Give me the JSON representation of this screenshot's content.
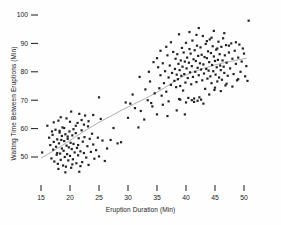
{
  "chart_data": {
    "type": "scatter",
    "title": "",
    "xlabel": "Eruption Duration (Min)",
    "ylabel": "Waiting Time Between Eruptions (Min)",
    "xlim": [
      13,
      52
    ],
    "ylim": [
      44,
      102
    ],
    "xticks": [
      15,
      20,
      25,
      30,
      35,
      40,
      45,
      50
    ],
    "yticks": [
      50,
      60,
      70,
      80,
      90,
      100
    ],
    "grid": false,
    "legend": null,
    "marker": {
      "shape": "square",
      "color": "#222222",
      "size": 2.2
    },
    "trendline": {
      "type": "lowess",
      "color": "#9a9a9a",
      "points": [
        [
          15.0,
          49.6
        ],
        [
          17.0,
          52.0
        ],
        [
          19.0,
          54.5
        ],
        [
          21.0,
          57.2
        ],
        [
          23.0,
          59.8
        ],
        [
          25.0,
          62.2
        ],
        [
          27.0,
          64.4
        ],
        [
          29.0,
          66.6
        ],
        [
          31.0,
          68.6
        ],
        [
          33.0,
          70.6
        ],
        [
          35.0,
          72.8
        ],
        [
          36.5,
          74.6
        ],
        [
          38.0,
          76.6
        ],
        [
          39.5,
          78.4
        ],
        [
          41.0,
          79.8
        ],
        [
          43.0,
          81.2
        ],
        [
          45.0,
          82.4
        ],
        [
          47.0,
          83.4
        ],
        [
          49.0,
          84.2
        ],
        [
          50.5,
          84.8
        ]
      ]
    },
    "points": [
      [
        15.2,
        51.6
      ],
      [
        16.1,
        61.0
      ],
      [
        16.4,
        56.8
      ],
      [
        16.6,
        54.2
      ],
      [
        16.8,
        49.5
      ],
      [
        17.0,
        57.8
      ],
      [
        17.1,
        52.6
      ],
      [
        17.2,
        55.3
      ],
      [
        17.3,
        48.4
      ],
      [
        17.5,
        59.6
      ],
      [
        17.6,
        53.6
      ],
      [
        17.7,
        50.8
      ],
      [
        17.8,
        56.2
      ],
      [
        17.9,
        47.6
      ],
      [
        18.0,
        62.8
      ],
      [
        18.1,
        54.8
      ],
      [
        18.2,
        58.6
      ],
      [
        18.3,
        51.2
      ],
      [
        18.4,
        49.0
      ],
      [
        18.5,
        56.0
      ],
      [
        18.6,
        53.0
      ],
      [
        18.7,
        60.4
      ],
      [
        18.8,
        47.0
      ],
      [
        18.9,
        52.2
      ],
      [
        19.0,
        55.6
      ],
      [
        19.1,
        50.0
      ],
      [
        19.2,
        58.0
      ],
      [
        19.3,
        46.6
      ],
      [
        19.4,
        54.0
      ],
      [
        19.5,
        51.0
      ],
      [
        19.6,
        57.2
      ],
      [
        19.7,
        48.8
      ],
      [
        19.8,
        53.4
      ],
      [
        19.9,
        59.0
      ],
      [
        20.0,
        50.4
      ],
      [
        20.1,
        55.0
      ],
      [
        20.2,
        46.2
      ],
      [
        20.3,
        52.8
      ],
      [
        20.4,
        57.6
      ],
      [
        20.5,
        49.2
      ],
      [
        20.6,
        54.6
      ],
      [
        20.8,
        51.6
      ],
      [
        21.0,
        58.4
      ],
      [
        21.1,
        47.8
      ],
      [
        21.2,
        53.2
      ],
      [
        21.3,
        62.0
      ],
      [
        21.4,
        50.6
      ],
      [
        21.5,
        56.6
      ],
      [
        21.6,
        44.8
      ],
      [
        21.8,
        52.0
      ],
      [
        22.0,
        59.4
      ],
      [
        22.1,
        48.2
      ],
      [
        22.2,
        55.4
      ],
      [
        22.4,
        51.4
      ],
      [
        22.5,
        57.0
      ],
      [
        22.6,
        64.6
      ],
      [
        22.8,
        49.8
      ],
      [
        23.0,
        53.8
      ],
      [
        23.1,
        60.8
      ],
      [
        23.2,
        47.2
      ],
      [
        23.4,
        56.4
      ],
      [
        23.6,
        51.8
      ],
      [
        23.8,
        58.2
      ],
      [
        24.0,
        54.4
      ],
      [
        24.2,
        49.4
      ],
      [
        24.5,
        52.4
      ],
      [
        24.8,
        56.8
      ],
      [
        25.0,
        50.2
      ],
      [
        25.3,
        63.4
      ],
      [
        25.6,
        55.8
      ],
      [
        26.0,
        48.6
      ],
      [
        26.4,
        53.0
      ],
      [
        27.0,
        56.0
      ],
      [
        27.5,
        60.2
      ],
      [
        28.2,
        54.8
      ],
      [
        28.8,
        55.2
      ],
      [
        19.4,
        63.6
      ],
      [
        20.2,
        66.0
      ],
      [
        21.6,
        65.2
      ],
      [
        18.4,
        64.0
      ],
      [
        17.2,
        62.2
      ],
      [
        22.4,
        61.4
      ],
      [
        24.0,
        64.8
      ],
      [
        25.0,
        71.0
      ],
      [
        20.6,
        59.8
      ],
      [
        19.0,
        60.2
      ],
      [
        18.2,
        59.2
      ],
      [
        21.0,
        61.0
      ],
      [
        23.2,
        62.6
      ],
      [
        22.0,
        63.0
      ],
      [
        16.9,
        59.0
      ],
      [
        18.6,
        57.4
      ],
      [
        20.0,
        62.4
      ],
      [
        19.6,
        56.4
      ],
      [
        21.4,
        54.2
      ],
      [
        17.8,
        51.4
      ],
      [
        18.0,
        45.8
      ],
      [
        19.2,
        44.6
      ],
      [
        20.4,
        47.4
      ],
      [
        21.8,
        46.8
      ],
      [
        30.0,
        63.8
      ],
      [
        30.4,
        68.8
      ],
      [
        31.2,
        67.2
      ],
      [
        31.8,
        60.4
      ],
      [
        32.2,
        66.2
      ],
      [
        32.8,
        63.2
      ],
      [
        33.4,
        70.0
      ],
      [
        33.8,
        76.6
      ],
      [
        34.2,
        67.8
      ],
      [
        34.6,
        72.4
      ],
      [
        35.0,
        65.0
      ],
      [
        35.2,
        81.6
      ],
      [
        35.4,
        74.2
      ],
      [
        35.6,
        78.8
      ],
      [
        35.8,
        71.6
      ],
      [
        36.0,
        83.0
      ],
      [
        36.2,
        76.0
      ],
      [
        36.4,
        80.2
      ],
      [
        36.6,
        73.0
      ],
      [
        36.8,
        85.8
      ],
      [
        37.0,
        78.0
      ],
      [
        37.2,
        82.2
      ],
      [
        37.4,
        75.4
      ],
      [
        37.6,
        79.6
      ],
      [
        37.8,
        87.0
      ],
      [
        38.0,
        76.8
      ],
      [
        38.1,
        81.0
      ],
      [
        38.2,
        84.6
      ],
      [
        38.3,
        74.6
      ],
      [
        38.4,
        79.0
      ],
      [
        38.5,
        86.2
      ],
      [
        38.6,
        77.4
      ],
      [
        38.7,
        82.8
      ],
      [
        38.8,
        70.4
      ],
      [
        38.9,
        80.6
      ],
      [
        39.0,
        75.0
      ],
      [
        39.1,
        84.0
      ],
      [
        39.2,
        78.6
      ],
      [
        39.3,
        88.4
      ],
      [
        39.4,
        81.8
      ],
      [
        39.5,
        73.4
      ],
      [
        39.6,
        86.8
      ],
      [
        39.7,
        79.2
      ],
      [
        39.8,
        83.6
      ],
      [
        39.9,
        76.2
      ],
      [
        40.0,
        90.2
      ],
      [
        40.1,
        81.2
      ],
      [
        40.2,
        85.0
      ],
      [
        40.3,
        77.8
      ],
      [
        40.4,
        70.8
      ],
      [
        40.5,
        83.2
      ],
      [
        40.6,
        88.0
      ],
      [
        40.7,
        79.8
      ],
      [
        40.8,
        86.4
      ],
      [
        40.9,
        75.6
      ],
      [
        41.0,
        82.0
      ],
      [
        41.1,
        91.0
      ],
      [
        41.2,
        78.2
      ],
      [
        41.3,
        84.4
      ],
      [
        41.4,
        70.6
      ],
      [
        41.5,
        87.6
      ],
      [
        41.6,
        80.0
      ],
      [
        41.7,
        83.8
      ],
      [
        41.8,
        76.4
      ],
      [
        41.9,
        89.2
      ],
      [
        42.0,
        81.4
      ],
      [
        42.1,
        85.6
      ],
      [
        42.2,
        78.8
      ],
      [
        42.3,
        71.0
      ],
      [
        42.4,
        83.0
      ],
      [
        42.5,
        88.6
      ],
      [
        42.6,
        80.8
      ],
      [
        42.7,
        86.0
      ],
      [
        42.8,
        77.0
      ],
      [
        42.9,
        92.6
      ],
      [
        43.0,
        82.6
      ],
      [
        43.1,
        79.4
      ],
      [
        43.2,
        85.2
      ],
      [
        43.3,
        74.0
      ],
      [
        43.4,
        89.8
      ],
      [
        43.5,
        81.0
      ],
      [
        43.6,
        84.8
      ],
      [
        43.7,
        77.6
      ],
      [
        43.8,
        87.2
      ],
      [
        43.9,
        80.4
      ],
      [
        44.0,
        83.4
      ],
      [
        44.1,
        91.4
      ],
      [
        44.2,
        78.4
      ],
      [
        44.3,
        86.6
      ],
      [
        44.4,
        76.0
      ],
      [
        44.5,
        82.4
      ],
      [
        44.6,
        89.0
      ],
      [
        44.7,
        80.2
      ],
      [
        44.8,
        85.4
      ],
      [
        44.9,
        73.6
      ],
      [
        45.0,
        83.8
      ],
      [
        45.1,
        79.0
      ],
      [
        45.2,
        87.8
      ],
      [
        45.3,
        81.6
      ],
      [
        45.4,
        76.6
      ],
      [
        45.5,
        84.2
      ],
      [
        45.6,
        90.6
      ],
      [
        45.7,
        78.0
      ],
      [
        45.8,
        86.2
      ],
      [
        45.9,
        82.2
      ],
      [
        46.0,
        80.6
      ],
      [
        46.1,
        88.8
      ],
      [
        46.2,
        77.2
      ],
      [
        46.3,
        84.0
      ],
      [
        46.4,
        91.8
      ],
      [
        46.5,
        81.8
      ],
      [
        46.6,
        79.6
      ],
      [
        46.7,
        85.8
      ],
      [
        46.8,
        75.2
      ],
      [
        46.9,
        89.4
      ],
      [
        47.0,
        83.2
      ],
      [
        47.2,
        78.6
      ],
      [
        47.4,
        86.8
      ],
      [
        47.6,
        81.2
      ],
      [
        47.8,
        90.0
      ],
      [
        48.0,
        84.6
      ],
      [
        48.2,
        79.2
      ],
      [
        48.4,
        87.4
      ],
      [
        48.6,
        82.8
      ],
      [
        48.8,
        77.0
      ],
      [
        49.0,
        85.0
      ],
      [
        49.2,
        89.6
      ],
      [
        49.4,
        80.0
      ],
      [
        49.6,
        83.6
      ],
      [
        49.8,
        88.2
      ],
      [
        50.0,
        86.4
      ],
      [
        50.2,
        78.4
      ],
      [
        50.4,
        82.0
      ],
      [
        50.6,
        76.8
      ],
      [
        50.8,
        98.0
      ],
      [
        33.0,
        73.8
      ],
      [
        34.0,
        69.0
      ],
      [
        36.0,
        68.4
      ],
      [
        37.0,
        69.6
      ],
      [
        38.4,
        66.4
      ],
      [
        39.0,
        70.2
      ],
      [
        40.0,
        69.2
      ],
      [
        41.0,
        70.0
      ],
      [
        41.4,
        69.4
      ],
      [
        42.0,
        69.8
      ],
      [
        42.6,
        70.2
      ],
      [
        43.0,
        68.8
      ],
      [
        39.8,
        65.0
      ],
      [
        36.8,
        64.4
      ],
      [
        44.0,
        72.0
      ],
      [
        45.0,
        74.4
      ],
      [
        46.0,
        73.2
      ],
      [
        47.0,
        75.8
      ],
      [
        48.0,
        74.8
      ],
      [
        49.0,
        77.4
      ],
      [
        30.8,
        72.0
      ],
      [
        32.0,
        78.2
      ],
      [
        33.6,
        80.0
      ],
      [
        34.4,
        83.4
      ],
      [
        29.6,
        69.2
      ],
      [
        35.6,
        87.4
      ],
      [
        37.4,
        90.4
      ],
      [
        38.8,
        93.2
      ],
      [
        40.6,
        94.0
      ],
      [
        42.2,
        95.4
      ],
      [
        44.4,
        92.0
      ],
      [
        46.6,
        93.6
      ],
      [
        43.6,
        90.8
      ],
      [
        45.4,
        88.2
      ],
      [
        47.4,
        89.2
      ],
      [
        35.0,
        84.8
      ],
      [
        36.6,
        88.8
      ],
      [
        41.8,
        93.0
      ],
      [
        44.8,
        94.4
      ],
      [
        48.6,
        90.4
      ]
    ]
  },
  "axes": {
    "tick_mark_color": "#1a1a1a",
    "tick_label_color": "#1a1a1a"
  }
}
